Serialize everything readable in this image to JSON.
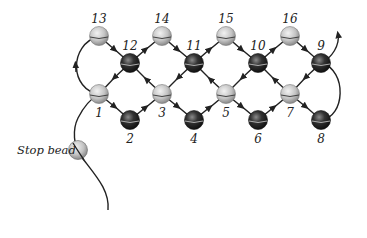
{
  "diagram": {
    "title": "",
    "stop_bead_label": "Stop bead",
    "colors": {
      "light_bead": "#c8c8c8",
      "dark_bead": "#2a2a2a",
      "thread": "#222222",
      "background": "#ffffff"
    },
    "beads": [
      {
        "id": "1",
        "label": "1",
        "type": "light",
        "x": 99,
        "y": 94,
        "label_pos": "below"
      },
      {
        "id": "2",
        "label": "2",
        "type": "dark",
        "x": 130,
        "y": 120,
        "label_pos": "below"
      },
      {
        "id": "3",
        "label": "3",
        "type": "light",
        "x": 162,
        "y": 94,
        "label_pos": "below"
      },
      {
        "id": "4",
        "label": "4",
        "type": "dark",
        "x": 194,
        "y": 120,
        "label_pos": "below"
      },
      {
        "id": "5",
        "label": "5",
        "type": "light",
        "x": 226,
        "y": 94,
        "label_pos": "below"
      },
      {
        "id": "6",
        "label": "6",
        "type": "dark",
        "x": 258,
        "y": 120,
        "label_pos": "below"
      },
      {
        "id": "7",
        "label": "7",
        "type": "light",
        "x": 290,
        "y": 94,
        "label_pos": "below"
      },
      {
        "id": "8",
        "label": "8",
        "type": "dark",
        "x": 321,
        "y": 120,
        "label_pos": "below"
      },
      {
        "id": "9",
        "label": "9",
        "type": "dark",
        "x": 321,
        "y": 63,
        "label_pos": "above"
      },
      {
        "id": "10",
        "label": "10",
        "type": "dark",
        "x": 258,
        "y": 63,
        "label_pos": "above"
      },
      {
        "id": "11",
        "label": "11",
        "type": "dark",
        "x": 194,
        "y": 63,
        "label_pos": "above"
      },
      {
        "id": "12",
        "label": "12",
        "type": "dark",
        "x": 130,
        "y": 63,
        "label_pos": "above"
      },
      {
        "id": "13",
        "label": "13",
        "type": "light",
        "x": 99,
        "y": 36,
        "label_pos": "above"
      },
      {
        "id": "14",
        "label": "14",
        "type": "light",
        "x": 162,
        "y": 36,
        "label_pos": "above"
      },
      {
        "id": "15",
        "label": "15",
        "type": "light",
        "x": 226,
        "y": 36,
        "label_pos": "above"
      },
      {
        "id": "16",
        "label": "16",
        "type": "light",
        "x": 290,
        "y": 36,
        "label_pos": "above"
      }
    ],
    "stop_bead": {
      "x": 78,
      "y": 150
    },
    "stitch_order": [
      "Stop bead",
      "1",
      "2",
      "3",
      "4",
      "5",
      "6",
      "7",
      "8",
      "9",
      "10",
      "11",
      "12",
      "13",
      "14",
      "15",
      "16"
    ]
  }
}
